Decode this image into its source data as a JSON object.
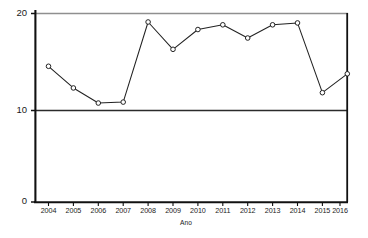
{
  "chart_data": {
    "type": "line",
    "title": "",
    "subtitle": "",
    "xlabel": "Ano",
    "ylabel": "",
    "categories": [
      "2004",
      "2005",
      "2006",
      "2007",
      "2008",
      "2009",
      "2010",
      "2011",
      "2012",
      "2013",
      "2014",
      "2015",
      "2016"
    ],
    "values": [
      14.4,
      12.1,
      10.5,
      10.6,
      19.1,
      16.2,
      18.3,
      18.8,
      17.4,
      18.8,
      19.0,
      11.6,
      13.6
    ],
    "series": [
      {
        "name": "Ano",
        "values": [
          14.4,
          12.1,
          10.5,
          10.6,
          19.1,
          16.2,
          18.3,
          18.8,
          17.4,
          18.8,
          19.0,
          11.6,
          13.6
        ]
      }
    ],
    "ylim": [
      0,
      20
    ],
    "ytick_labels": [
      "20",
      "10",
      "0"
    ],
    "ytick_values": [
      20,
      10,
      0
    ],
    "xtick_labels": [
      "2004",
      "2005",
      "2006",
      "2007",
      "2008",
      "2009",
      "2010",
      "2011",
      "2012",
      "2013",
      "2014",
      "2015",
      "2016"
    ],
    "grid": false,
    "gridlines_horizontal": [
      20,
      10
    ],
    "legend": false,
    "legend_position": "none",
    "marker": "open-circle",
    "line_color": "#222222",
    "marker_color": "#222222",
    "axis_color": "#111111",
    "gridline_color_top": "#8a8a8a",
    "gridline_color_mid": "#2b2b2b",
    "background_color": "#ffffff",
    "annotations": []
  },
  "axes": {
    "x_title": "Ano",
    "y_ticks": [
      {
        "label": "20",
        "value": 20
      },
      {
        "label": "10",
        "value": 10
      },
      {
        "label": "0",
        "value": 0
      }
    ],
    "x_ticks": [
      {
        "label": "2004"
      },
      {
        "label": "2005"
      },
      {
        "label": "2006"
      },
      {
        "label": "2007"
      },
      {
        "label": "2008"
      },
      {
        "label": "2009"
      },
      {
        "label": "2010"
      },
      {
        "label": "2011"
      },
      {
        "label": "2012"
      },
      {
        "label": "2013"
      },
      {
        "label": "2014"
      },
      {
        "label": "2015"
      },
      {
        "label": "2016"
      }
    ]
  }
}
